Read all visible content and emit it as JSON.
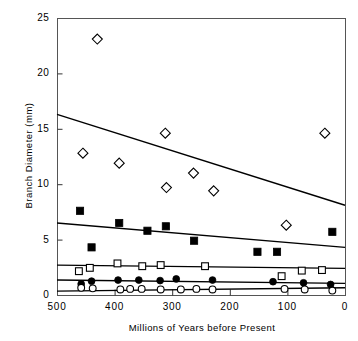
{
  "chart_data": {
    "type": "scatter",
    "title": "",
    "xlabel": "Millions of Years before Present",
    "ylabel": "Branch Diameter (mm)",
    "xlim": [
      500,
      0
    ],
    "ylim": [
      0,
      25
    ],
    "x_reversed": true,
    "grid": false,
    "legend": "none",
    "xticks": [
      500,
      400,
      300,
      200,
      100,
      0
    ],
    "xtick_labels": [
      "500",
      "400",
      "300",
      "200",
      "100",
      "0"
    ],
    "yticks": [
      0,
      5,
      10,
      15,
      20,
      25
    ],
    "ytick_labels": [
      "0",
      "5",
      "10",
      "15",
      "20",
      "25"
    ],
    "series": [
      {
        "name": "open-diamond",
        "marker": "open-diamond",
        "color": "#000000",
        "points": [
          {
            "x": 455,
            "y": 12.8
          },
          {
            "x": 430,
            "y": 23.1
          },
          {
            "x": 392,
            "y": 11.9
          },
          {
            "x": 312,
            "y": 14.6
          },
          {
            "x": 310,
            "y": 9.7
          },
          {
            "x": 263,
            "y": 11.0
          },
          {
            "x": 228,
            "y": 9.4
          },
          {
            "x": 102,
            "y": 6.3
          },
          {
            "x": 35,
            "y": 14.6
          }
        ],
        "fit_line": {
          "x1": 500,
          "y1": 16.3,
          "x2": 0,
          "y2": 8.1
        }
      },
      {
        "name": "filled-square",
        "marker": "filled-square",
        "color": "#000000",
        "points": [
          {
            "x": 460,
            "y": 7.6
          },
          {
            "x": 440,
            "y": 4.3
          },
          {
            "x": 392,
            "y": 6.5
          },
          {
            "x": 343,
            "y": 5.8
          },
          {
            "x": 311,
            "y": 6.2
          },
          {
            "x": 262,
            "y": 4.9
          },
          {
            "x": 152,
            "y": 3.9
          },
          {
            "x": 118,
            "y": 3.9
          },
          {
            "x": 22,
            "y": 5.7
          }
        ],
        "fit_line": {
          "x1": 500,
          "y1": 6.5,
          "x2": 0,
          "y2": 4.3
        }
      },
      {
        "name": "open-square",
        "marker": "open-square",
        "color": "#000000",
        "points": [
          {
            "x": 462,
            "y": 2.15
          },
          {
            "x": 443,
            "y": 2.45
          },
          {
            "x": 395,
            "y": 2.85
          },
          {
            "x": 352,
            "y": 2.6
          },
          {
            "x": 320,
            "y": 2.7
          },
          {
            "x": 243,
            "y": 2.6
          },
          {
            "x": 110,
            "y": 1.7
          },
          {
            "x": 75,
            "y": 2.2
          },
          {
            "x": 40,
            "y": 2.25
          }
        ],
        "fit_line": {
          "x1": 500,
          "y1": 2.7,
          "x2": 0,
          "y2": 2.4
        }
      },
      {
        "name": "filled-circle",
        "marker": "filled-circle",
        "color": "#000000",
        "points": [
          {
            "x": 458,
            "y": 1.0
          },
          {
            "x": 440,
            "y": 1.25
          },
          {
            "x": 394,
            "y": 1.35
          },
          {
            "x": 358,
            "y": 1.35
          },
          {
            "x": 321,
            "y": 1.3
          },
          {
            "x": 293,
            "y": 1.45
          },
          {
            "x": 230,
            "y": 1.35
          },
          {
            "x": 125,
            "y": 1.2
          },
          {
            "x": 72,
            "y": 1.1
          },
          {
            "x": 25,
            "y": 0.95
          }
        ],
        "fit_line": {
          "x1": 500,
          "y1": 1.35,
          "x2": 0,
          "y2": 1.05
        }
      },
      {
        "name": "open-circle",
        "marker": "open-circle",
        "color": "#000000",
        "points": [
          {
            "x": 458,
            "y": 0.65
          },
          {
            "x": 438,
            "y": 0.6
          },
          {
            "x": 390,
            "y": 0.5
          },
          {
            "x": 373,
            "y": 0.55
          },
          {
            "x": 353,
            "y": 0.55
          },
          {
            "x": 320,
            "y": 0.5
          },
          {
            "x": 285,
            "y": 0.5
          },
          {
            "x": 258,
            "y": 0.55
          },
          {
            "x": 230,
            "y": 0.5
          },
          {
            "x": 105,
            "y": 0.55
          },
          {
            "x": 70,
            "y": 0.5
          },
          {
            "x": 22,
            "y": 0.4
          }
        ],
        "fit_line": {
          "x1": 500,
          "y1": 0.35,
          "x2": 0,
          "y2": 0.65
        }
      }
    ]
  },
  "axes": {
    "plot_left_px": 57,
    "plot_right_px": 345,
    "plot_top_px": 18,
    "plot_bottom_px": 295
  }
}
